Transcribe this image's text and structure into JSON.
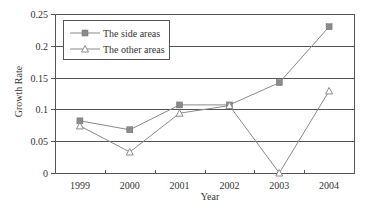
{
  "chart_data": {
    "type": "line",
    "title": "",
    "xlabel": "Year",
    "ylabel": "Growth Rate",
    "categories": [
      "1999",
      "2000",
      "2001",
      "2002",
      "2003",
      "2004"
    ],
    "series": [
      {
        "name": "The side areas",
        "marker": "square",
        "values": [
          0.082,
          0.068,
          0.107,
          0.107,
          0.142,
          0.23
        ]
      },
      {
        "name": "The other areas",
        "marker": "triangle",
        "values": [
          0.074,
          0.033,
          0.094,
          0.106,
          0.0,
          0.129
        ]
      }
    ],
    "ylim": [
      0,
      0.25
    ],
    "yticks": [
      "0",
      "0.05",
      "0.1",
      "0.15",
      "0.2",
      "0.25"
    ],
    "grid": true,
    "legend_position": "upper left",
    "colors": {
      "line": "#8a8a8a",
      "grid": "#555555",
      "axis": "#555555"
    }
  },
  "legend": {
    "items": [
      {
        "label": "The side areas"
      },
      {
        "label": "The other areas"
      }
    ]
  },
  "axes": {
    "xlabel": "Year",
    "ylabel": "Growth Rate"
  }
}
